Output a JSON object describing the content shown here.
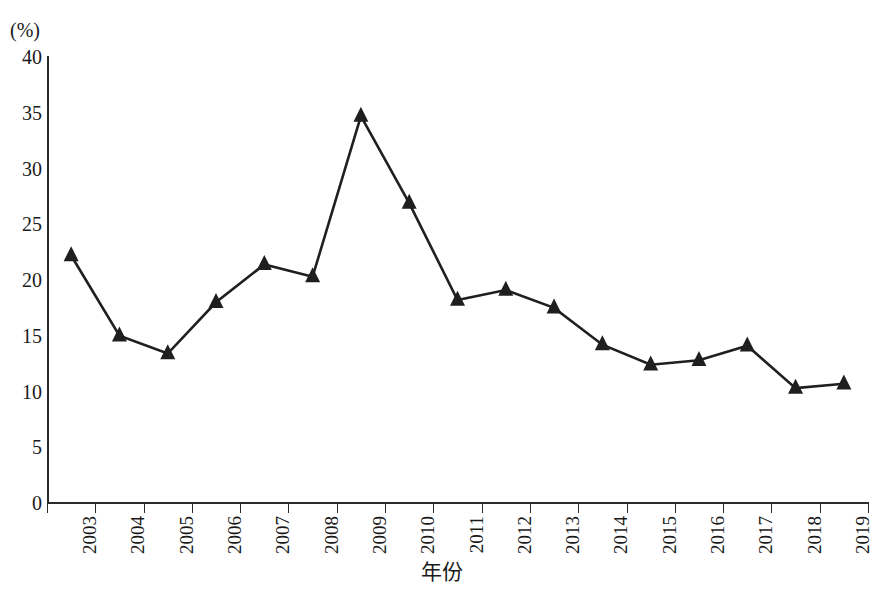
{
  "chart_data": {
    "type": "line",
    "title": "",
    "subtitle": "",
    "xlabel": "年份",
    "ylabel": "",
    "yunit": "(%)",
    "categories": [
      "2003",
      "2004",
      "2005",
      "2006",
      "2007",
      "2008",
      "2009",
      "2010",
      "2011",
      "2012",
      "2013",
      "2014",
      "2015",
      "2016",
      "2017",
      "2018",
      "2019"
    ],
    "values": [
      22.2,
      15.0,
      13.4,
      18.0,
      21.4,
      20.3,
      34.7,
      26.9,
      18.2,
      19.1,
      17.5,
      14.2,
      12.4,
      12.8,
      14.1,
      10.3,
      10.7
    ],
    "series": [
      {
        "name": "",
        "marker": "triangle-up",
        "color": "#1f1f1f",
        "values": [
          22.2,
          15.0,
          13.4,
          18.0,
          21.4,
          20.3,
          34.7,
          26.9,
          18.2,
          19.1,
          17.5,
          14.2,
          12.4,
          12.8,
          14.1,
          10.3,
          10.7
        ]
      }
    ],
    "ylim": [
      0,
      40
    ],
    "yticks": [
      0,
      5,
      10,
      15,
      20,
      25,
      30,
      35,
      40
    ],
    "ytick_labels": [
      "0",
      "5",
      "10",
      "15",
      "20",
      "25",
      "30",
      "35",
      "40"
    ],
    "grid": false,
    "legend": null,
    "legend_position": "none",
    "annotations": [],
    "axis_style": {
      "left_spine": true,
      "bottom_spine": true,
      "top_spine": false,
      "right_spine": false,
      "xtick_rotation": 90,
      "line_color": "#1f1f1f",
      "background": "#ffffff"
    }
  }
}
